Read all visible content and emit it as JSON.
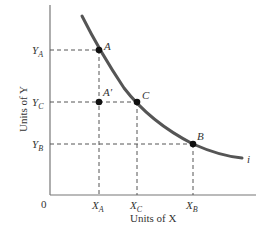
{
  "diagram": {
    "type": "indifference-curve",
    "x_axis_label": "Units of X",
    "y_axis_label": "Units of Y",
    "origin_label": "0",
    "curve_label": "i",
    "points": [
      {
        "id": "A",
        "label": "A",
        "x_tick": "X",
        "x_sub": "A",
        "y_tick": "Y",
        "y_sub": "A"
      },
      {
        "id": "A_prime",
        "label": "A′"
      },
      {
        "id": "C",
        "label": "C",
        "x_tick": "X",
        "x_sub": "C",
        "y_tick": "Y",
        "y_sub": "C"
      },
      {
        "id": "B",
        "label": "B",
        "x_tick": "X",
        "x_sub": "B",
        "y_tick": "Y",
        "y_sub": "B"
      }
    ],
    "colors": {
      "axis": "#777777",
      "curve": "#555555",
      "dash": "#555555",
      "point": "#111111",
      "text": "#333333"
    }
  }
}
